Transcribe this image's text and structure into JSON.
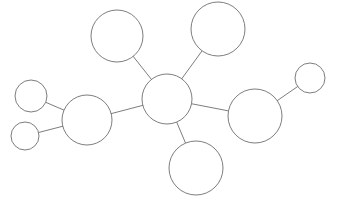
{
  "figure": {
    "kind": "node-link-network-diagram",
    "width": 338,
    "height": 206,
    "background_color": "#ffffff",
    "stroke_color": "#6e6e6e",
    "node_fill_color": "#ffffff",
    "stroke_width": 0.9,
    "title": "",
    "labels_visible": false
  },
  "chart_data": {
    "type": "scatter",
    "title": "",
    "xlabel": "",
    "ylabel": "",
    "grid": false,
    "legend": "none",
    "xlim": [
      0,
      338
    ],
    "ylim": [
      206,
      0
    ],
    "nodes": [
      {
        "id": "hub",
        "name": "center-hub-node",
        "x": 167,
        "y": 99,
        "r": 25,
        "label": ""
      },
      {
        "id": "top_middle",
        "name": "top-middle-node",
        "x": 117,
        "y": 36,
        "r": 26,
        "label": ""
      },
      {
        "id": "top_right",
        "name": "top-right-node",
        "x": 218,
        "y": 29,
        "r": 27,
        "label": ""
      },
      {
        "id": "bottom_middle",
        "name": "bottom-middle-node",
        "x": 196,
        "y": 168,
        "r": 27,
        "label": ""
      },
      {
        "id": "left_large",
        "name": "left-large-node",
        "x": 87,
        "y": 120,
        "r": 25,
        "label": ""
      },
      {
        "id": "right_large",
        "name": "right-large-node",
        "x": 255,
        "y": 116,
        "r": 27,
        "label": ""
      },
      {
        "id": "small_upper_left",
        "name": "small-upper-left-node",
        "x": 31,
        "y": 96,
        "r": 16,
        "label": ""
      },
      {
        "id": "small_lower_left",
        "name": "small-lower-left-node",
        "x": 25,
        "y": 136,
        "r": 14,
        "label": ""
      },
      {
        "id": "small_far_right",
        "name": "small-far-right-node",
        "x": 310,
        "y": 78,
        "r": 15,
        "label": ""
      }
    ],
    "edges": [
      {
        "id": "edge_hub_top_middle",
        "name": "edge-hub-to-top-middle",
        "source": "hub",
        "target": "top_middle"
      },
      {
        "id": "edge_hub_top_right",
        "name": "edge-hub-to-top-right",
        "source": "hub",
        "target": "top_right"
      },
      {
        "id": "edge_hub_bottom_middle",
        "name": "edge-hub-to-bottom-middle",
        "source": "hub",
        "target": "bottom_middle"
      },
      {
        "id": "edge_hub_left_large",
        "name": "edge-hub-to-left-large",
        "source": "hub",
        "target": "left_large"
      },
      {
        "id": "edge_hub_right_large",
        "name": "edge-hub-to-right-large",
        "source": "hub",
        "target": "right_large"
      },
      {
        "id": "edge_left_large_small_upper_left",
        "name": "edge-left-large-to-small-upper-left",
        "source": "left_large",
        "target": "small_upper_left"
      },
      {
        "id": "edge_left_large_small_lower_left",
        "name": "edge-left-large-to-small-lower-left",
        "source": "left_large",
        "target": "small_lower_left"
      },
      {
        "id": "edge_right_large_small_far_right",
        "name": "edge-right-large-to-small-far-right",
        "source": "right_large",
        "target": "small_far_right"
      }
    ],
    "node_count": 9,
    "edge_count": 8
  }
}
